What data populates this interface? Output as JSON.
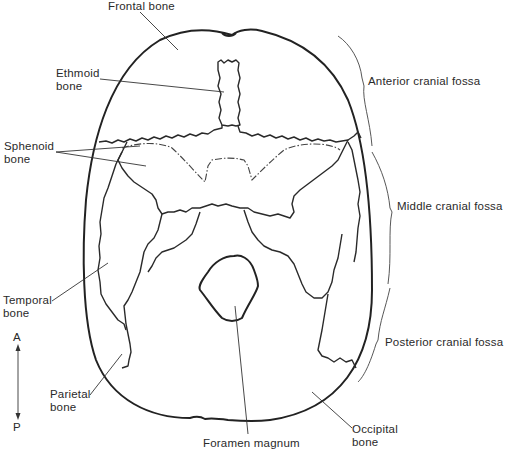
{
  "figure": {
    "type": "anatomical-diagram",
    "colors": {
      "line": "#222222",
      "background": "#ffffff",
      "text": "#2a2a2a"
    }
  },
  "labels": {
    "frontal_bone": "Frontal bone",
    "ethmoid_bone_line1": "Ethmoid",
    "ethmoid_bone_line2": "bone",
    "sphenoid_bone_line1": "Sphenoid",
    "sphenoid_bone_line2": "bone",
    "temporal_bone_line1": "Temporal",
    "temporal_bone_line2": "bone",
    "parietal_bone_line1": "Parietal",
    "parietal_bone_line2": "bone",
    "occipital_bone_line1": "Occipital",
    "occipital_bone_line2": "bone",
    "foramen_magnum": "Foramen magnum"
  },
  "fossae": [
    {
      "label": "Anterior cranial fossa"
    },
    {
      "label": "Middle cranial fossa"
    },
    {
      "label": "Posterior cranial fossa"
    }
  ],
  "orientation": {
    "anterior": "A",
    "posterior": "P"
  }
}
